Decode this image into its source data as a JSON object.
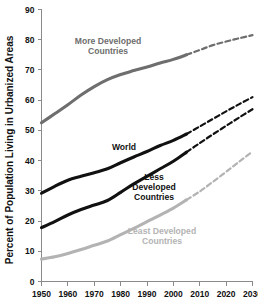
{
  "chart_data": {
    "type": "line",
    "title": "",
    "xlabel": "",
    "ylabel": "Percent of Population Living in Urbanized Areas",
    "xlim": [
      1950,
      2030
    ],
    "ylim": [
      0,
      90
    ],
    "xticks": [
      1950,
      1960,
      1970,
      1980,
      1990,
      2000,
      2010,
      2020,
      2030
    ],
    "yticks": [
      0,
      10,
      20,
      30,
      40,
      50,
      60,
      70,
      80,
      90
    ],
    "grid": false,
    "legend": "inline-labels",
    "x": [
      1950,
      1955,
      1960,
      1965,
      1970,
      1975,
      1980,
      1985,
      1990,
      1995,
      2000,
      2005,
      2010,
      2015,
      2020,
      2025,
      2030
    ],
    "series": [
      {
        "name": "More Developed Countries",
        "color": "#6e6e6e",
        "label_lines": [
          "More Developed",
          "Countries"
        ],
        "historical_end_year": 2005,
        "values": [
          52.5,
          55.5,
          58.5,
          61.7,
          64.5,
          66.8,
          68.5,
          69.8,
          71.0,
          72.3,
          73.5,
          75.0,
          76.6,
          78.2,
          79.4,
          80.5,
          81.5
        ]
      },
      {
        "name": "World",
        "color": "#111111",
        "label_lines": [
          "World"
        ],
        "historical_end_year": 2005,
        "values": [
          29.2,
          31.5,
          33.5,
          34.8,
          36.0,
          37.3,
          39.3,
          41.2,
          43.0,
          45.0,
          46.7,
          48.8,
          51.3,
          53.8,
          56.3,
          58.7,
          61.0
        ]
      },
      {
        "name": "Less Developed Countries",
        "color": "#111111",
        "label_lines": [
          "Less",
          "Developed",
          "Countries"
        ],
        "historical_end_year": 2005,
        "values": [
          17.8,
          19.8,
          22.0,
          23.8,
          25.3,
          26.8,
          29.5,
          32.3,
          34.8,
          37.3,
          39.8,
          42.8,
          45.8,
          48.7,
          51.5,
          54.3,
          57.0
        ]
      },
      {
        "name": "Least Developed Countries",
        "color": "#b3b3b3",
        "label_lines": [
          "Least Developed",
          "Countries"
        ],
        "historical_end_year": 2005,
        "values": [
          7.4,
          8.2,
          9.3,
          10.6,
          12.0,
          13.4,
          15.5,
          17.6,
          19.8,
          22.0,
          24.3,
          27.0,
          29.8,
          33.0,
          36.3,
          39.7,
          43.0
        ]
      }
    ],
    "annotations": [
      {
        "text": "More Developed Countries",
        "x_px": 108,
        "y_px": 48,
        "color": "#6e6e6e",
        "align": "middle"
      },
      {
        "text": "World",
        "x_px": 123,
        "y_px": 148,
        "color": "#111111",
        "align": "middle"
      },
      {
        "text": "Less Developed Countries",
        "x_px": 152,
        "y_px": 186,
        "color": "#111111",
        "align": "middle"
      },
      {
        "text": "Least Developed Countries",
        "x_px": 160,
        "y_px": 237,
        "color": "#b3b3b3",
        "align": "middle"
      }
    ]
  },
  "labels": {
    "y_axis_title": "Percent of Population Living in Urbanized Areas",
    "y_ticks": [
      "0",
      "10",
      "20",
      "30",
      "40",
      "50",
      "60",
      "70",
      "80",
      "90"
    ],
    "x_ticks": [
      "1950",
      "1960",
      "1970",
      "1980",
      "1990",
      "2000",
      "2010",
      "2020",
      "2030"
    ],
    "series_more_developed_1": "More Developed",
    "series_more_developed_2": "Countries",
    "series_world": "World",
    "series_less_developed_1": "Less",
    "series_less_developed_2": "Developed",
    "series_less_developed_3": "Countries",
    "series_least_developed_1": "Least Developed",
    "series_least_developed_2": "Countries"
  }
}
